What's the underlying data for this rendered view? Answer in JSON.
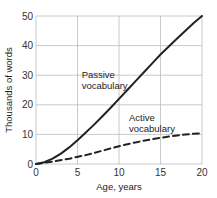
{
  "chart_data": {
    "type": "line",
    "title": "",
    "xlabel": "Age, years",
    "ylabel": "Thousands of words",
    "xlim": [
      0,
      20
    ],
    "ylim": [
      0,
      50
    ],
    "xticks": [
      0,
      5,
      10,
      15,
      20
    ],
    "yticks": [
      0,
      10,
      20,
      30,
      40,
      50
    ],
    "grid": true,
    "legend": "inline annotations",
    "series": [
      {
        "name": "Passive vocabulary",
        "style": "solid",
        "x": [
          0,
          1,
          2,
          3,
          4,
          5,
          6,
          7,
          8,
          9,
          10,
          11,
          12,
          13,
          14,
          15,
          16,
          17,
          18,
          19,
          20
        ],
        "values": [
          0,
          0.6,
          1.8,
          3.5,
          5.6,
          8,
          10.6,
          13.3,
          16.1,
          19,
          22,
          25,
          28,
          31,
          34,
          37,
          39.7,
          42.4,
          45,
          47.6,
          50
        ]
      },
      {
        "name": "Active vocabulary",
        "style": "dashed",
        "x": [
          0,
          2,
          4,
          6,
          8,
          10,
          12,
          14,
          16,
          18,
          20
        ],
        "values": [
          0,
          0.8,
          1.8,
          3,
          4.5,
          6,
          7.3,
          8.4,
          9.3,
          10,
          10.4
        ]
      }
    ],
    "annotations": [
      {
        "text": [
          "Passive",
          "vocabulary"
        ],
        "x": 5.5,
        "y": 29
      },
      {
        "text": [
          "Active",
          "vocabulary"
        ],
        "x": 11.2,
        "y": 14.5
      }
    ]
  }
}
